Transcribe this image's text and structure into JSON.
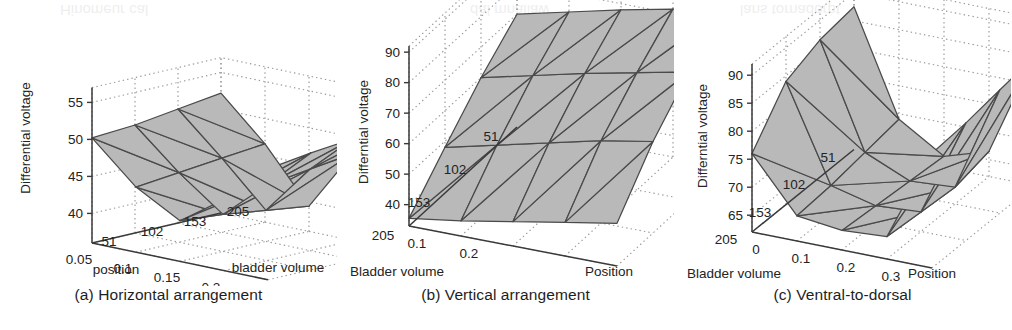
{
  "figure": {
    "background_color": "#ffffff",
    "surface_fill_color": "#b9b9b9",
    "mesh_line_color": "#4a4a4a",
    "grid_color": "#9a9a9a",
    "axis_color": "#3a3a3a",
    "bleed_through_text": [
      "Hinomeur cal",
      "dal mnallaw",
      "lans tornadorpt"
    ]
  },
  "panels": [
    {
      "id": "a",
      "caption": "(a) Horizontal arrangement",
      "chart_data": {
        "type": "surface",
        "title": "(a) Horizontal arrangement",
        "xlabel": "position",
        "ylabel": "bladder volume",
        "zlabel": "Differential voltage",
        "x": [
          0.05,
          0.1,
          0.15,
          0.2,
          0.25
        ],
        "y": [
          51,
          102,
          153,
          205
        ],
        "xticks": [
          "0.05",
          "0.1",
          "0.15",
          "0.2",
          "0.25"
        ],
        "yticks": [
          "51",
          "102",
          "153",
          "205"
        ],
        "zticks": [
          40,
          45,
          50,
          55
        ],
        "zlim": [
          36,
          57
        ],
        "grid": true,
        "legend": "none",
        "z": [
          [
            50.2,
            44.8,
            41.5,
            45.6,
            51.0
          ],
          [
            50.6,
            45.4,
            41.0,
            46.2,
            51.8
          ],
          [
            51.4,
            46.0,
            40.2,
            47.0,
            52.4
          ],
          [
            52.2,
            46.6,
            39.4,
            47.8,
            53.0
          ]
        ]
      }
    },
    {
      "id": "b",
      "caption": "(b) Vertical arrangement",
      "chart_data": {
        "type": "surface",
        "title": "(b) Vertical arrangement",
        "xlabel": "Position",
        "ylabel": "Bladder volume",
        "zlabel": "Differntial voltage",
        "x": [
          0.1,
          0.2
        ],
        "y": [
          205,
          153,
          102,
          51
        ],
        "xticks": [
          "0.1",
          "0.2"
        ],
        "yticks": [
          "205",
          "153",
          "102",
          "51"
        ],
        "zticks": [
          40,
          50,
          60,
          70,
          80,
          90
        ],
        "zlim": [
          33,
          92
        ],
        "grid": true,
        "legend": "none",
        "z": [
          [
            35.5,
            38.0,
            41.0,
            44.0,
            47.0
          ],
          [
            48.0,
            52.0,
            56.0,
            60.0,
            63.0
          ],
          [
            60.0,
            64.0,
            68.0,
            71.5,
            75.0
          ],
          [
            70.0,
            74.0,
            78.0,
            81.5,
            85.0
          ]
        ]
      }
    },
    {
      "id": "c",
      "caption": "(c) Ventral-to-dorsal",
      "chart_data": {
        "type": "surface",
        "title": "(c) Ventral-to-dorsal",
        "xlabel": "Position",
        "ylabel": "Bladder volume",
        "zlabel": "Differntial voltage",
        "x": [
          0,
          0.1,
          0.2,
          0.3
        ],
        "y": [
          205,
          153,
          102,
          51
        ],
        "xticks": [
          "0",
          "0.1",
          "0.2",
          "0.3"
        ],
        "yticks": [
          "205",
          "153",
          "102",
          "51"
        ],
        "zticks": [
          65,
          70,
          75,
          80,
          85,
          90
        ],
        "zlim": [
          62,
          92
        ],
        "grid": true,
        "legend": "none",
        "z": [
          [
            76.0,
            66.5,
            65.5,
            66.0,
            82.5
          ],
          [
            84.0,
            67.0,
            65.0,
            65.5,
            83.0
          ],
          [
            86.5,
            68.0,
            64.5,
            65.0,
            84.0
          ],
          [
            87.5,
            69.0,
            64.0,
            66.5,
            85.0
          ]
        ]
      }
    }
  ]
}
